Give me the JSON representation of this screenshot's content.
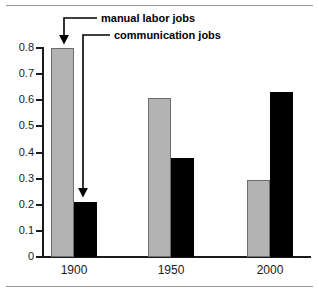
{
  "chart_data": {
    "type": "bar",
    "title": "",
    "subtitle": "",
    "xlabel": "",
    "ylabel": "",
    "categories": [
      "1900",
      "1950",
      "2000"
    ],
    "series": [
      {
        "name": "manual labor jobs",
        "color": "#b3b3b3",
        "values": [
          0.8,
          0.61,
          0.295
        ]
      },
      {
        "name": "communication jobs",
        "color": "#000000",
        "values": [
          0.21,
          0.38,
          0.63
        ]
      }
    ],
    "ylim": [
      0,
      0.8
    ],
    "ytick_values": [
      0,
      0.1,
      0.2,
      0.3,
      0.4,
      0.5,
      0.6,
      0.7,
      0.8
    ],
    "ytick_labels": [
      "0",
      "0.1",
      "0.2",
      "0.3",
      "0.4",
      "0.5",
      "0.6",
      "0.7",
      "0.8"
    ],
    "grid": false,
    "legend_position": "none",
    "annotations": [
      {
        "text": "manual labor jobs",
        "points_to": "1900 manual labor jobs bar"
      },
      {
        "text": "communication jobs",
        "points_to": "1900 communication jobs bar"
      }
    ]
  },
  "rules": {
    "top": "horizontal-rule",
    "bottom": "horizontal-rule"
  }
}
